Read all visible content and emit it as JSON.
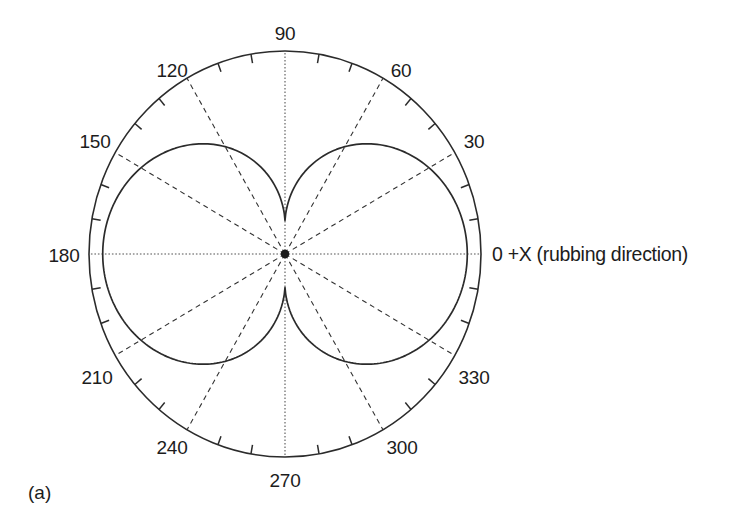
{
  "figure": {
    "panel_caption": "(a)",
    "axis_note": "0 +X (rubbing direction)",
    "background_color": "#ffffff",
    "line_color": "#2b2b2b",
    "grid_color": "#333333"
  },
  "labels": {
    "deg_0": "0",
    "deg_30": "30",
    "deg_60": "60",
    "deg_90": "90",
    "deg_120": "120",
    "deg_150": "150",
    "deg_180": "180",
    "deg_210": "210",
    "deg_240": "240",
    "deg_270": "270",
    "deg_300": "300",
    "deg_330": "330"
  },
  "chart_data": {
    "type": "line",
    "projection": "polar",
    "title": "",
    "subtitle": "",
    "xlabel": "0 +X (rubbing direction)",
    "ylabel": "",
    "annotations": [
      "(a)",
      "0 +X (rubbing direction)"
    ],
    "grid": true,
    "legend": null,
    "angle_unit": "degrees",
    "angle_direction": "counterclockwise",
    "angle_zero_at": "east",
    "theta_tick_labels": [
      0,
      30,
      60,
      90,
      120,
      150,
      180,
      210,
      240,
      270,
      300,
      330
    ],
    "theta_major_step": 30,
    "theta_minor_step": 10,
    "r_range": [
      0,
      1.0
    ],
    "r_outer_ring": 1.0,
    "r_max_of_curve": 0.93,
    "r_min_of_curve": 0.165,
    "series": [
      {
        "name": "polar intensity",
        "theta": [
          0,
          10,
          20,
          30,
          40,
          50,
          60,
          70,
          80,
          85,
          90,
          95,
          100,
          110,
          120,
          130,
          140,
          150,
          160,
          170,
          180,
          190,
          200,
          210,
          220,
          230,
          240,
          250,
          260,
          270,
          275,
          280,
          290,
          300,
          310,
          320,
          330,
          340,
          350,
          360
        ],
        "r": [
          0.93,
          0.925,
          0.91,
          0.885,
          0.845,
          0.79,
          0.715,
          0.615,
          0.45,
          0.31,
          0.165,
          0.31,
          0.45,
          0.615,
          0.715,
          0.79,
          0.845,
          0.885,
          0.91,
          0.925,
          0.93,
          0.925,
          0.91,
          0.885,
          0.845,
          0.79,
          0.715,
          0.615,
          0.45,
          0.165,
          0.31,
          0.45,
          0.615,
          0.715,
          0.79,
          0.845,
          0.885,
          0.91,
          0.925,
          0.93
        ]
      }
    ]
  }
}
